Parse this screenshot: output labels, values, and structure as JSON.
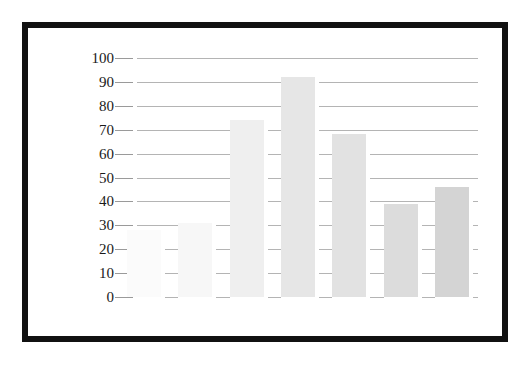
{
  "chart_data": {
    "type": "bar",
    "title": "",
    "subtitle": "",
    "xlabel": "",
    "ylabel": "",
    "categories": [
      "1",
      "2",
      "3",
      "4",
      "5",
      "6",
      "7"
    ],
    "values": [
      28,
      31,
      74,
      92,
      68,
      39,
      46
    ],
    "series": [
      {
        "name": "",
        "values": [
          28,
          31,
          74,
          92,
          68,
          39,
          46
        ]
      }
    ],
    "ylim": [
      0,
      100
    ],
    "y_ticks": [
      0,
      10,
      20,
      30,
      40,
      50,
      60,
      70,
      80,
      90,
      100
    ],
    "y_tick_labels": [
      "0",
      "10",
      "20",
      "30",
      "40",
      "50",
      "60",
      "70",
      "80",
      "90",
      "100"
    ],
    "x_tick_labels": [],
    "grid": true,
    "grid_axis": "y",
    "legend": false,
    "legend_position": "none",
    "annotations": [],
    "bar_colors": [
      "#fbfbfb",
      "#f7f7f7",
      "#efefef",
      "#e6e6e6",
      "#e2e2e2",
      "#dcdcdc",
      "#d4d4d4"
    ],
    "gridline_color": "#9a9a9a",
    "axis_text_color": "#1a1a1a",
    "frame_color": "#111111",
    "background_color": "#ffffff"
  }
}
